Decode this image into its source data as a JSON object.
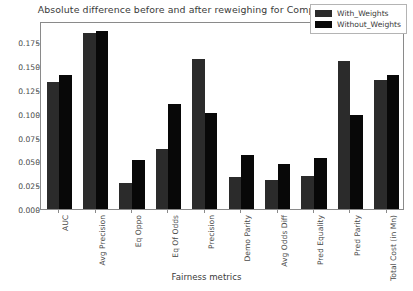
{
  "chart_data": {
    "type": "bar",
    "title": "Absolute difference before and after reweighing for Composite feature",
    "xlabel": "Fairness metrics",
    "ylabel": "",
    "ylim": [
      0.0,
      0.1975
    ],
    "grid": false,
    "legend_position": "upper right",
    "categories": [
      "AUC",
      "Avg Precision",
      "Eq Oppo",
      "Eq Of Odds",
      "Precision",
      "Demo Parity",
      "Avg Odds Diff",
      "Pred Equality",
      "Pred Parity",
      "Total Cost (in Mn)"
    ],
    "yticks": [
      "0.000",
      "0.025",
      "0.050",
      "0.075",
      "0.100",
      "0.125",
      "0.150",
      "0.175"
    ],
    "ytick_values": [
      0.0,
      0.025,
      0.05,
      0.075,
      0.1,
      0.125,
      0.15,
      0.175
    ],
    "series": [
      {
        "name": "With_Weights",
        "color": "#2b2b2b",
        "values": [
          0.133,
          0.185,
          0.027,
          0.063,
          0.158,
          0.034,
          0.031,
          0.035,
          0.155,
          0.136
        ]
      },
      {
        "name": "Without_Weights",
        "color": "#080808",
        "values": [
          0.141,
          0.187,
          0.052,
          0.11,
          0.101,
          0.057,
          0.047,
          0.054,
          0.099,
          0.141
        ]
      }
    ]
  }
}
